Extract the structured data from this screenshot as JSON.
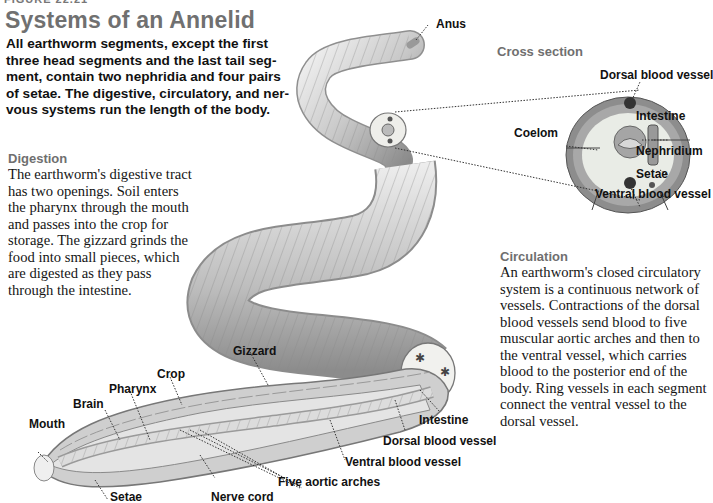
{
  "figure": {
    "label": "FIGURE 22.21",
    "title": "Systems of an Annelid",
    "intro": "All earthworm segments, except the first three head segments and the last tail segment, contain two nephridia and four pairs of setae. The digestive, circulatory, and nervous systems run the length of the body.",
    "intro_lines": [
      "All earthworm segments, except the first",
      "three head segments and the last tail seg-",
      "ment, contain two nephridia and four pairs",
      "of setae. The digestive, circulatory, and ner-",
      "vous systems run the length of the body."
    ]
  },
  "digestion": {
    "heading": "Digestion",
    "lines": [
      "The earthworm's digestive tract",
      "has two openings. Soil enters",
      "the pharynx through the mouth",
      "and passes into the crop for",
      "storage. The gizzard grinds the",
      "food into small pieces, which",
      "are digested as they pass",
      "through the intestine."
    ]
  },
  "circulation": {
    "heading": "Circulation",
    "lines": [
      "An earthworm's closed circulatory",
      "system is a continuous network of",
      "vessels. Contractions of the dorsal",
      "blood vessels send blood to five",
      "muscular aortic arches and then to",
      "the ventral vessel, which carries",
      "blood to the posterior end of the",
      "body. Ring vessels in each segment",
      "connect the ventral vessel to the",
      "dorsal vessel."
    ]
  },
  "cross_section": {
    "heading": "Cross section",
    "labels": {
      "dorsal": "Dorsal blood vessel",
      "intestine": "Intestine",
      "coelom": "Coelom",
      "nephridium": "Nephridium",
      "setae": "Setae",
      "ventral": "Ventral blood vessel"
    }
  },
  "worm_labels": {
    "anus": "Anus",
    "gizzard": "Gizzard",
    "crop": "Crop",
    "pharynx": "Pharynx",
    "brain": "Brain",
    "mouth": "Mouth",
    "setae": "Setae",
    "nerve_cord": "Nerve cord",
    "aortic_arches": "Five aortic arches",
    "ventral": "Ventral blood vessel",
    "dorsal": "Dorsal blood vessel",
    "intestine": "Intestine"
  },
  "colors": {
    "heading_gray": "#707070",
    "text": "#111111",
    "worm_light": "#e6e6e6",
    "worm_mid": "#b4b4b4",
    "worm_dark": "#7a7a7a"
  }
}
